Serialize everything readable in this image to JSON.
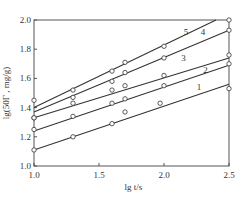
{
  "chart_data": {
    "type": "line",
    "title": "",
    "xlabel": "lg t/s",
    "ylabel": "lg(50Γ, mg/g)",
    "xlim": [
      1.0,
      2.5
    ],
    "ylim": [
      1.0,
      2.0
    ],
    "x_ticks": [
      "1.0",
      "1.5",
      "2.0",
      "2.5"
    ],
    "y_ticks": [
      "1.0",
      "1.2",
      "1.4",
      "1.6",
      "1.8",
      "2.0"
    ],
    "grid": false,
    "legend": "inline labels",
    "series": [
      {
        "name": "1",
        "points": [
          [
            1.0,
            1.11
          ],
          [
            1.3,
            1.2
          ],
          [
            1.6,
            1.29
          ],
          [
            1.7,
            1.37
          ],
          [
            1.97,
            1.43
          ],
          [
            2.5,
            1.53
          ]
        ],
        "fit": [
          [
            1.0,
            1.11
          ],
          [
            2.5,
            1.56
          ]
        ]
      },
      {
        "name": "2",
        "points": [
          [
            1.0,
            1.25
          ],
          [
            1.3,
            1.34
          ],
          [
            1.6,
            1.43
          ],
          [
            1.7,
            1.46
          ],
          [
            2.0,
            1.55
          ],
          [
            2.5,
            1.7
          ]
        ],
        "fit": [
          [
            1.0,
            1.24
          ],
          [
            2.5,
            1.69
          ]
        ]
      },
      {
        "name": "3",
        "points": [
          [
            1.0,
            1.33
          ],
          [
            1.3,
            1.43
          ],
          [
            1.6,
            1.52
          ],
          [
            1.7,
            1.55
          ],
          [
            2.0,
            1.62
          ],
          [
            2.5,
            1.76
          ]
        ],
        "fit": [
          [
            1.0,
            1.33
          ],
          [
            2.5,
            1.74
          ]
        ]
      },
      {
        "name": "4",
        "points": [
          [
            1.0,
            1.33
          ],
          [
            1.3,
            1.47
          ],
          [
            1.6,
            1.58
          ],
          [
            1.7,
            1.64
          ],
          [
            2.0,
            1.74
          ],
          [
            2.5,
            1.93
          ]
        ],
        "fit": [
          [
            1.0,
            1.37
          ],
          [
            2.5,
            1.93
          ]
        ]
      },
      {
        "name": "5",
        "points": [
          [
            1.0,
            1.45
          ],
          [
            1.3,
            1.52
          ],
          [
            1.6,
            1.65
          ],
          [
            1.7,
            1.71
          ],
          [
            2.0,
            1.82
          ],
          [
            2.5,
            2.0
          ]
        ],
        "fit": [
          [
            1.0,
            1.4
          ],
          [
            2.4,
            2.0
          ]
        ]
      }
    ],
    "series_label_positions": [
      {
        "name": "1",
        "x": 2.27,
        "y": 1.52
      },
      {
        "name": "2",
        "x": 2.32,
        "y": 1.64
      },
      {
        "name": "3",
        "x": 2.15,
        "y": 1.72
      },
      {
        "name": "4",
        "x": 2.3,
        "y": 1.9
      },
      {
        "name": "5",
        "x": 2.17,
        "y": 1.9
      }
    ]
  },
  "labels": {
    "xlabel": "lg t/s",
    "ylabel": "lg(50Γ , mg/g)"
  },
  "colors": {
    "line": "#333333",
    "axis": "#555555",
    "marker_fill": "#ffffff"
  }
}
